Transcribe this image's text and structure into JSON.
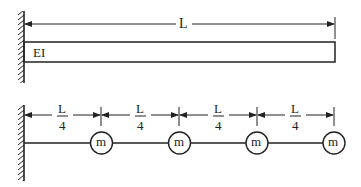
{
  "diagram": {
    "type": "structural-mechanics",
    "colors": {
      "stroke": "#222222",
      "background": "#ffffff"
    },
    "top_figure": {
      "name": "cantilever-beam",
      "support": "fixed-wall",
      "beam_label": "EI",
      "length_label": "L"
    },
    "bottom_figure": {
      "name": "lumped-mass-model",
      "support": "fixed-wall",
      "segment_labels": [
        {
          "numerator": "L",
          "denominator": "4"
        },
        {
          "numerator": "L",
          "denominator": "4"
        },
        {
          "numerator": "L",
          "denominator": "4"
        },
        {
          "numerator": "L",
          "denominator": "4"
        }
      ],
      "masses": [
        {
          "label": "m"
        },
        {
          "label": "m"
        },
        {
          "label": "m"
        },
        {
          "label": "m"
        }
      ]
    }
  }
}
